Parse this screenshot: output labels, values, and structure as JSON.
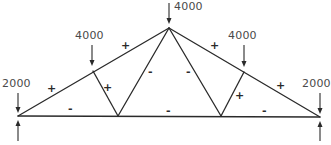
{
  "diagram": {
    "type": "truss",
    "colors": {
      "line": "#2a2a2a",
      "text": "#4a4a4a",
      "background": "#ffffff"
    },
    "loads": [
      {
        "id": "left-support-load",
        "value": "2000"
      },
      {
        "id": "left-panel-load",
        "value": "4000"
      },
      {
        "id": "apex-load",
        "value": "4000"
      },
      {
        "id": "right-panel-load",
        "value": "4000"
      },
      {
        "id": "right-support-load",
        "value": "2000"
      }
    ],
    "member_signs": {
      "left_top_chord_outer": "+",
      "left_top_chord_inner": "+",
      "right_top_chord_inner": "+",
      "right_top_chord_outer": "+",
      "left_vertical_web": "+",
      "right_vertical_web": "+",
      "left_diagonal_web": "-",
      "right_diagonal_web": "-",
      "bottom_chord_left": "-",
      "bottom_chord_middle": "-",
      "bottom_chord_right": "-"
    }
  }
}
